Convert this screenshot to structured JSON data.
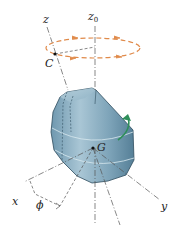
{
  "figure": {
    "labels": {
      "z": "z",
      "z0": "z",
      "z0_sub": "0",
      "C": "C",
      "G": "G",
      "x": "x",
      "y": "y",
      "phi": "ϕ"
    },
    "colors": {
      "body_fill": "#8fb3c6",
      "body_shade": "#5e8aa3",
      "body_edge": "#2f4d5e",
      "precession_path": "#e08a4a",
      "spin_arrow": "#2f8f5a",
      "axis_line": "#555555"
    }
  }
}
